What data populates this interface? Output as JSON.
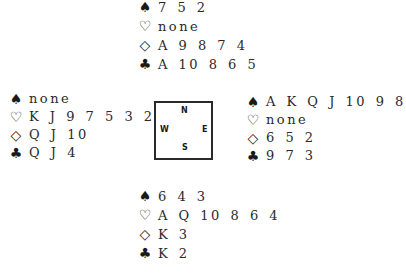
{
  "suits": {
    "spades": "♠",
    "hearts": "♡",
    "diamonds": "◇",
    "clubs": "♣"
  },
  "compass": {
    "north": "N",
    "south": "S",
    "west": "W",
    "east": "E"
  },
  "hands": {
    "north": {
      "spades": "7 5 2",
      "hearts": "none",
      "diamonds": "A 9 8 7 4",
      "clubs": "A 10 8 6 5"
    },
    "west": {
      "spades": "none",
      "hearts": "K J 9 7 5 3 2",
      "diamonds": "Q J 10",
      "clubs": "Q J 4"
    },
    "east": {
      "spades": "A K Q J 10 9 8",
      "hearts": "none",
      "diamonds": "6 5 2",
      "clubs": "9 7 3"
    },
    "south": {
      "spades": "6 4 3",
      "hearts": "A Q 10 8 6 4",
      "diamonds": "K 3",
      "clubs": "K 2"
    }
  }
}
